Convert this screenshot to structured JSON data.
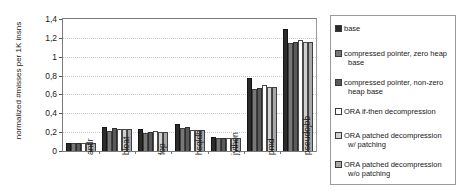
{
  "chart_data": {
    "type": "bar",
    "title": "",
    "xlabel": "",
    "ylabel": "normalized #misses per 1K insns",
    "ylim": [
      0,
      1.4
    ],
    "grid": true,
    "legend_position": "right",
    "ytick_labels": [
      "0",
      "0,2",
      "0,4",
      "0,6",
      "0,8",
      "1",
      "1,2",
      "1,4"
    ],
    "ytick_values": [
      0,
      0.2,
      0.4,
      0.6,
      0.8,
      1.0,
      1.2,
      1.4
    ],
    "categories": [
      "antlr",
      "bloat",
      "fop",
      "hsqldb",
      "jython",
      "pmd",
      "pseudojbb"
    ],
    "series": [
      {
        "name": "base",
        "color": "#2b2b2b",
        "values": [
          0.08,
          0.25,
          0.23,
          0.285,
          0.145,
          0.77,
          1.29
        ]
      },
      {
        "name": "compressed pointer, zero heap base",
        "color": "#777777",
        "values": [
          0.08,
          0.21,
          0.19,
          0.245,
          0.14,
          0.655,
          1.15
        ]
      },
      {
        "name": "compressed pointer, non-zero heap base",
        "color": "#5a5a5a",
        "values": [
          0.08,
          0.245,
          0.205,
          0.25,
          0.14,
          0.665,
          1.155
        ]
      },
      {
        "name": "ORA if-then decompression",
        "color": "#ffffff",
        "values": [
          0.08,
          0.235,
          0.21,
          0.225,
          0.14,
          0.695,
          1.18
        ]
      },
      {
        "name": "ORA patched decompression w/ patching",
        "color": "#d0d0d0",
        "values": [
          0.09,
          0.235,
          0.205,
          0.225,
          0.14,
          0.675,
          1.155
        ]
      },
      {
        "name": "ORA patched decompression w/o patching",
        "color": "#a8a8a8",
        "values": [
          0.09,
          0.235,
          0.205,
          0.225,
          0.14,
          0.675,
          1.155
        ]
      }
    ]
  },
  "legend": {
    "items": [
      {
        "label": "base",
        "label_line1": "base",
        "label_line2": ""
      },
      {
        "label": "compressed pointer, zero heap base",
        "label_line1": "compressed pointer, zero heap",
        "label_line2": "base"
      },
      {
        "label": "compressed pointer, non-zero heap base",
        "label_line1": "compressed pointer, non-zero",
        "label_line2": "heap base"
      },
      {
        "label": "ORA if-then decompression",
        "label_line1": "ORA if-then decompression",
        "label_line2": ""
      },
      {
        "label": "ORA patched decompression w/ patching",
        "label_line1": "ORA patched decompression",
        "label_line2": "w/ patching"
      },
      {
        "label": "ORA patched decompression w/o patching",
        "label_line1": "ORA patched decompression",
        "label_line2": "w/o patching"
      }
    ]
  }
}
